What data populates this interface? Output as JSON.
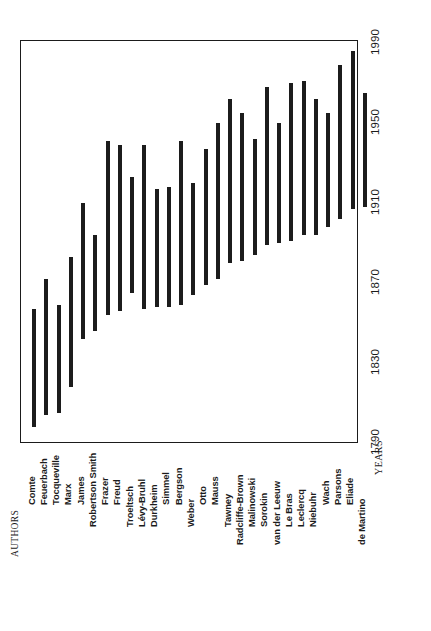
{
  "chart_data": {
    "type": "bar",
    "orientation": "vertical-rotated",
    "title": "",
    "subtitle": "",
    "xlabel": "AUTHORS",
    "ylabel": "YEARS",
    "ylim": [
      1790,
      1990
    ],
    "yticks": [
      "1790",
      "1830",
      "1870",
      "1910",
      "1950",
      "1990"
    ],
    "grid": false,
    "legend": null,
    "bar_color": "#1c1c1c",
    "frame_color": "#1b1b1b",
    "background": "#ffffff",
    "note": "Each bar spans an author's birth year to death year.",
    "categories": [
      "Comte",
      "Feuerbach",
      "Tocqueville",
      "Marx",
      "James",
      "Robertson Smith",
      "Frazer",
      "Freud",
      "Troeltsch",
      "Lévy-Bruhl",
      "Durkheim",
      "Simmel",
      "Bergson",
      "Weber",
      "Otto",
      "Mauss",
      "Tawney",
      "Radcliffe-Brown",
      "Malinowski",
      "Sorokin",
      "van der Leeuw",
      "Le Bras",
      "Leclercq",
      "Niebuhr",
      "Wach",
      "Parsons",
      "Eliade",
      "de Martino"
    ],
    "series": [
      {
        "name": "Lifespan",
        "spans": [
          {
            "label": "Comte",
            "start": 1798,
            "end": 1857
          },
          {
            "label": "Feuerbach",
            "start": 1804,
            "end": 1872
          },
          {
            "label": "Tocqueville",
            "start": 1805,
            "end": 1859
          },
          {
            "label": "Marx",
            "start": 1818,
            "end": 1883
          },
          {
            "label": "James",
            "start": 1842,
            "end": 1910
          },
          {
            "label": "Robertson Smith",
            "start": 1846,
            "end": 1894
          },
          {
            "label": "Frazer",
            "start": 1854,
            "end": 1941
          },
          {
            "label": "Freud",
            "start": 1856,
            "end": 1939
          },
          {
            "label": "Troeltsch",
            "start": 1865,
            "end": 1923
          },
          {
            "label": "Lévy-Bruhl",
            "start": 1857,
            "end": 1939
          },
          {
            "label": "Durkheim",
            "start": 1858,
            "end": 1917
          },
          {
            "label": "Simmel",
            "start": 1858,
            "end": 1918
          },
          {
            "label": "Bergson",
            "start": 1859,
            "end": 1941
          },
          {
            "label": "Weber",
            "start": 1864,
            "end": 1920
          },
          {
            "label": "Otto",
            "start": 1869,
            "end": 1937
          },
          {
            "label": "Mauss",
            "start": 1872,
            "end": 1950
          },
          {
            "label": "Tawney",
            "start": 1880,
            "end": 1962
          },
          {
            "label": "Radcliffe-Brown",
            "start": 1881,
            "end": 1955
          },
          {
            "label": "Malinowski",
            "start": 1884,
            "end": 1942
          },
          {
            "label": "Sorokin",
            "start": 1889,
            "end": 1968
          },
          {
            "label": "van der Leeuw",
            "start": 1890,
            "end": 1950
          },
          {
            "label": "Le Bras",
            "start": 1891,
            "end": 1970
          },
          {
            "label": "Leclercq",
            "start": 1894,
            "end": 1971
          },
          {
            "label": "Niebuhr",
            "start": 1894,
            "end": 1962
          },
          {
            "label": "Wach",
            "start": 1898,
            "end": 1955
          },
          {
            "label": "Parsons",
            "start": 1902,
            "end": 1979
          },
          {
            "label": "Eliade",
            "start": 1907,
            "end": 1986
          },
          {
            "label": "de Martino",
            "start": 1908,
            "end": 1965
          }
        ]
      }
    ]
  },
  "axes": {
    "years": {
      "title": "YEARS",
      "ticks": [
        {
          "value": 1990,
          "label": "1990"
        },
        {
          "value": 1950,
          "label": "1950"
        },
        {
          "value": 1910,
          "label": "1910"
        },
        {
          "value": 1870,
          "label": "1870"
        },
        {
          "value": 1830,
          "label": "1830"
        },
        {
          "value": 1790,
          "label": "1790"
        }
      ]
    },
    "authors": {
      "title": "AUTHORS"
    }
  }
}
